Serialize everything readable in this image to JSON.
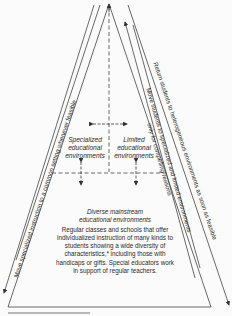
{
  "diagram": {
    "type": "pyramid",
    "boxes": {
      "specialized": {
        "label": "Specialized educational environments",
        "lines": [
          "Specialized",
          "educational",
          "environments"
        ]
      },
      "limited": {
        "label": "Limited educational environments",
        "lines": [
          "Limited",
          "educational",
          "environments"
        ]
      },
      "mainstream": {
        "title_lines": [
          "Diverse mainstream",
          "educational environments"
        ],
        "body_lines": [
          "Regular classes and schools that offer",
          "individualized instruction of many kinds to",
          "students showing a wide diversity of",
          "characteristics,* including those with",
          "handicaps or gifts. Special educators work",
          "in support of regular teachers."
        ]
      }
    },
    "arrows": {
      "left_down": "Move specialized instruction to a common setting whenever feasible",
      "right_up_1": "Move students to specialized and limited environments",
      "right_up_2": "only for compelling reasons",
      "right_down": "Return students to heterogeneous environments as soon as feasible"
    },
    "colors": {
      "line": "#333333",
      "background": "#fbfbfb"
    }
  }
}
